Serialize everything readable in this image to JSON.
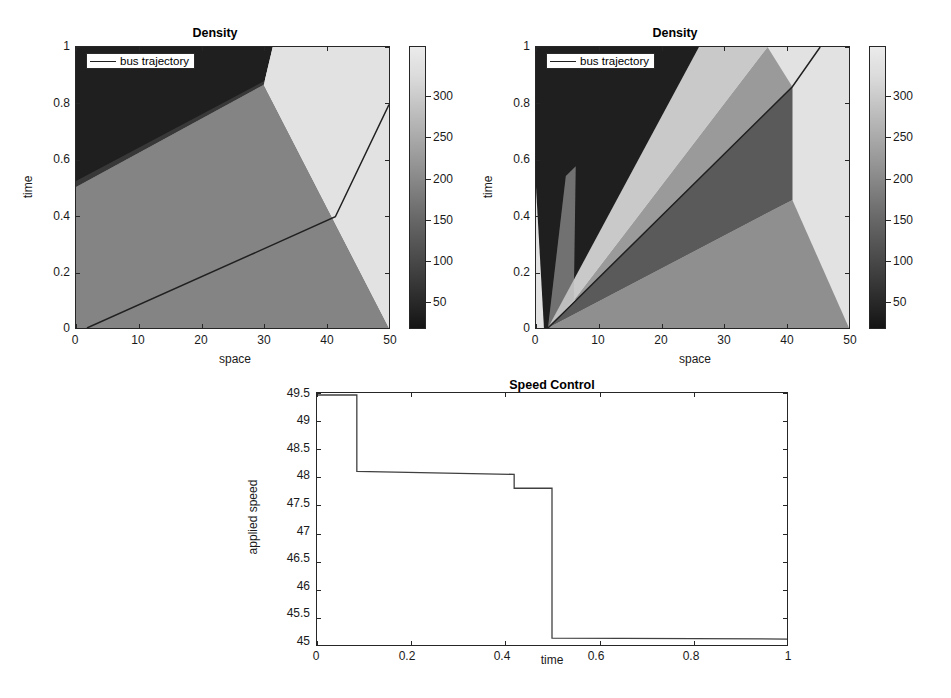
{
  "figure": {
    "width": 951,
    "height": 698,
    "background": "#ffffff",
    "caption": ""
  },
  "palette": {
    "level1_darkest": "#1f1f1f",
    "level2_dark": "#5a5a5a",
    "level3_mid": "#848484",
    "level4_light": "#b4b4b4",
    "level5_lightest": "#e2e2e2",
    "line": "#202020",
    "axis": "#262626",
    "text": "#1a1a1a"
  },
  "panels": {
    "left_density": {
      "title": "Density",
      "xlabel": "space",
      "ylabel": "time",
      "xticks": [
        "0",
        "10",
        "20",
        "30",
        "40",
        "50"
      ],
      "yticks": [
        "0",
        "0.2",
        "0.4",
        "0.6",
        "0.8",
        "1"
      ],
      "legend_label": "bus trajectory",
      "colorbar_ticks": [
        "50",
        "100",
        "150",
        "200",
        "250",
        "300"
      ]
    },
    "right_density": {
      "title": "Density",
      "xlabel": "space",
      "ylabel": "time",
      "xticks": [
        "0",
        "10",
        "20",
        "30",
        "40",
        "50"
      ],
      "yticks": [
        "0",
        "0.2",
        "0.4",
        "0.6",
        "0.8",
        "1"
      ],
      "legend_label": "bus trajectory",
      "colorbar_ticks": [
        "50",
        "100",
        "150",
        "200",
        "250",
        "300"
      ]
    },
    "speed_control": {
      "title": "Speed Control",
      "xlabel": "time",
      "ylabel": "applied speed",
      "xticks": [
        "0",
        "0.2",
        "0.4",
        "0.6",
        "0.8",
        "1"
      ],
      "yticks": [
        "45",
        "45.5",
        "46",
        "46.5",
        "47",
        "47.5",
        "48",
        "48.5",
        "49",
        "49.5"
      ]
    }
  },
  "chart_data": [
    {
      "id": "left_density",
      "type": "heatmap",
      "title": "Density",
      "xlabel": "space",
      "ylabel": "time",
      "xlim": [
        0,
        50
      ],
      "ylim": [
        0,
        1
      ],
      "colorbar": {
        "label": "",
        "ticks": [
          50,
          100,
          150,
          200,
          250,
          300
        ],
        "range": [
          0,
          340
        ],
        "colormap": "gray"
      },
      "regions": [
        {
          "name": "free-flow-dark",
          "density": 30,
          "color": "#1f1f1f",
          "polygon": [
            [
              0,
              0.5
            ],
            [
              0,
              1.0
            ],
            [
              31.5,
              1.0
            ],
            [
              30.0,
              0.865
            ]
          ]
        },
        {
          "name": "medium-gray",
          "density": 160,
          "color": "#848484",
          "polygon": [
            [
              0,
              0.0
            ],
            [
              0,
              0.5
            ],
            [
              30.0,
              0.865
            ],
            [
              50,
              0.0
            ]
          ]
        },
        {
          "name": "congested-light",
          "density": 320,
          "color": "#e2e2e2",
          "polygon": [
            [
              31.5,
              1.0
            ],
            [
              30.0,
              0.865
            ],
            [
              50,
              0.0
            ],
            [
              50,
              1.0
            ]
          ]
        }
      ],
      "bus_trajectory": {
        "legend": "bus trajectory",
        "points": [
          [
            1.8,
            0.0
          ],
          [
            41.5,
            0.395
          ],
          [
            50,
            0.795
          ]
        ]
      }
    },
    {
      "id": "right_density",
      "type": "heatmap",
      "title": "Density",
      "xlabel": "space",
      "ylabel": "time",
      "xlim": [
        0,
        50
      ],
      "ylim": [
        0,
        1
      ],
      "colorbar": {
        "label": "",
        "ticks": [
          50,
          100,
          150,
          200,
          250,
          300
        ],
        "range": [
          0,
          340
        ],
        "colormap": "gray"
      },
      "regions": [
        {
          "name": "free-flow-dark",
          "density": 30,
          "color": "#1f1f1f",
          "polygon": [
            [
              0,
              0.5
            ],
            [
              0,
              1.0
            ],
            [
              26.0,
              1.0
            ],
            [
              2.0,
              0.0
            ],
            [
              1.5,
              0.0
            ]
          ]
        },
        {
          "name": "light-band",
          "density": 300,
          "color": "#c9c9c9",
          "polygon": [
            [
              2.0,
              0.0
            ],
            [
              26.0,
              1.0
            ],
            [
              37.0,
              1.0
            ],
            [
              6.0,
              0.1
            ]
          ]
        },
        {
          "name": "mid-band",
          "density": 190,
          "color": "#9a9a9a",
          "polygon": [
            [
              6.0,
              0.1
            ],
            [
              37.0,
              1.0
            ],
            [
              41.0,
              0.86
            ],
            [
              41.0,
              0.455
            ]
          ]
        },
        {
          "name": "dark-wedge",
          "density": 70,
          "color": "#5a5a5a",
          "polygon": [
            [
              2.0,
              0.0
            ],
            [
              41.0,
              0.86
            ],
            [
              41.0,
              0.455
            ]
          ]
        },
        {
          "name": "lower-gray",
          "density": 150,
          "color": "#8f8f8f",
          "polygon": [
            [
              2.0,
              0.0
            ],
            [
              41.0,
              0.455
            ],
            [
              50,
              0.0
            ]
          ]
        },
        {
          "name": "congested-light",
          "density": 330,
          "color": "#e2e2e2",
          "polygon": [
            [
              41.0,
              0.86
            ],
            [
              41.0,
              0.455
            ],
            [
              50,
              0.0
            ],
            [
              50,
              1.0
            ],
            [
              45.5,
              1.0
            ]
          ]
        }
      ],
      "bus_trajectory": {
        "legend": "bus trajectory",
        "points": [
          [
            2.0,
            0.0
          ],
          [
            41.0,
            0.86
          ],
          [
            45.5,
            1.0
          ]
        ]
      }
    },
    {
      "id": "speed_control",
      "type": "line",
      "step": true,
      "title": "Speed Control",
      "xlabel": "time",
      "ylabel": "applied speed",
      "xlim": [
        0,
        1
      ],
      "ylim": [
        45,
        49.5
      ],
      "grid": false,
      "x": [
        0.0,
        0.085,
        0.085,
        0.42,
        0.42,
        0.5,
        0.5,
        1.0
      ],
      "y": [
        49.47,
        49.47,
        48.11,
        48.06,
        47.8,
        47.8,
        45.13,
        45.11
      ],
      "series": [
        {
          "name": "applied speed",
          "steps": [
            {
              "t_start": 0.0,
              "t_end": 0.085,
              "value": 49.47
            },
            {
              "t_start": 0.085,
              "t_end": 0.42,
              "value": 48.1
            },
            {
              "t_start": 0.42,
              "t_end": 0.5,
              "value": 47.8
            },
            {
              "t_start": 0.5,
              "t_end": 1.0,
              "value": 45.12
            }
          ]
        }
      ]
    }
  ]
}
